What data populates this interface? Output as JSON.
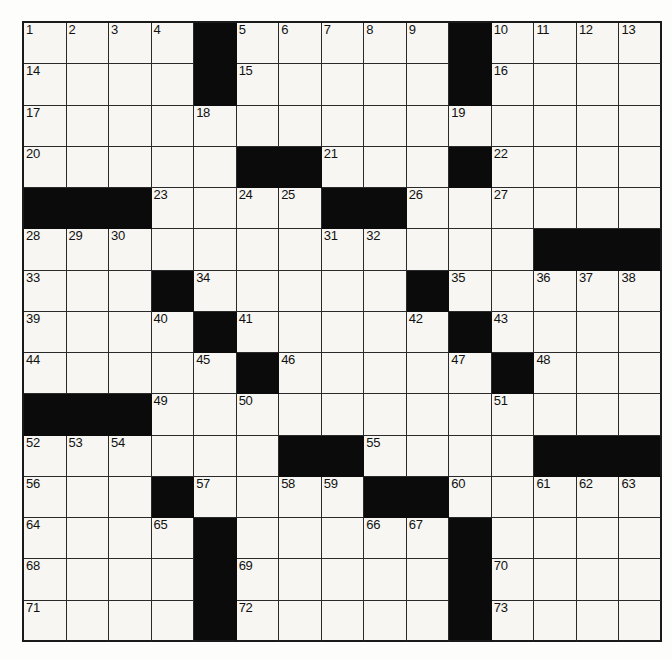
{
  "puzzle": {
    "type": "crossword-grid",
    "rows": 15,
    "columns": 15,
    "cell_background": "#f7f6f2",
    "block_color": "#0b0b0b",
    "line_color": "#2a2a2a",
    "page_background": "#fdfdfb",
    "total_clue_numbers": 73,
    "grid": [
      [
        "1",
        "2",
        "3",
        "4",
        "#",
        "5",
        "6",
        "7",
        "8",
        "9",
        "#",
        "10",
        "11",
        "12",
        "13"
      ],
      [
        "14",
        "",
        "",
        "",
        "#",
        "15",
        "",
        "",
        "",
        "",
        "#",
        "16",
        "",
        "",
        ""
      ],
      [
        "17",
        "",
        "",
        "",
        "18",
        "",
        "",
        "",
        "",
        "",
        "19",
        "",
        "",
        "",
        ""
      ],
      [
        "20",
        "",
        "",
        "",
        "",
        "#",
        "#",
        "21",
        "",
        "",
        "#",
        "22",
        "",
        "",
        ""
      ],
      [
        "#",
        "#",
        "#",
        "23",
        "",
        "24",
        "25",
        "#",
        "#",
        "26",
        "",
        "27",
        "",
        "",
        ""
      ],
      [
        "28",
        "29",
        "30",
        "",
        "",
        "",
        "",
        "31",
        "32",
        "",
        "",
        "",
        "#",
        "#",
        "#"
      ],
      [
        "33",
        "",
        "",
        "#",
        "34",
        "",
        "",
        "",
        "",
        "#",
        "35",
        "",
        "36",
        "37",
        "38"
      ],
      [
        "39",
        "",
        "",
        "40",
        "#",
        "41",
        "",
        "",
        "",
        "42",
        "#",
        "43",
        "",
        "",
        ""
      ],
      [
        "44",
        "",
        "",
        "",
        "45",
        "#",
        "46",
        "",
        "",
        "",
        "47",
        "#",
        "48",
        "",
        ""
      ],
      [
        "#",
        "#",
        "#",
        "49",
        "",
        "50",
        "",
        "",
        "",
        "",
        "",
        "51",
        "",
        "",
        ""
      ],
      [
        "52",
        "53",
        "54",
        "",
        "",
        "",
        "#",
        "#",
        "55",
        "",
        "",
        "",
        "#",
        "#",
        "#"
      ],
      [
        "56",
        "",
        "",
        "#",
        "57",
        "",
        "58",
        "59",
        "#",
        "#",
        "60",
        "",
        "61",
        "62",
        "63"
      ],
      [
        "64",
        "",
        "",
        "65",
        "",
        "",
        "",
        "",
        "66",
        "67",
        "",
        "",
        "",
        "",
        ""
      ],
      [
        "68",
        "",
        "",
        "",
        "#",
        "69",
        "",
        "",
        "",
        "",
        "#",
        "70",
        "",
        "",
        ""
      ],
      [
        "71",
        "",
        "",
        "",
        "#",
        "72",
        "",
        "",
        "",
        "",
        "#",
        "73",
        "",
        "",
        ""
      ]
    ],
    "numbered_cells": [
      {
        "n": "1",
        "row": 0,
        "col": 0
      },
      {
        "n": "2",
        "row": 0,
        "col": 1
      },
      {
        "n": "3",
        "row": 0,
        "col": 2
      },
      {
        "n": "4",
        "row": 0,
        "col": 3
      },
      {
        "n": "5",
        "row": 0,
        "col": 5
      },
      {
        "n": "6",
        "row": 0,
        "col": 6
      },
      {
        "n": "7",
        "row": 0,
        "col": 7
      },
      {
        "n": "8",
        "row": 0,
        "col": 8
      },
      {
        "n": "9",
        "row": 0,
        "col": 9
      },
      {
        "n": "10",
        "row": 0,
        "col": 11
      },
      {
        "n": "11",
        "row": 0,
        "col": 12
      },
      {
        "n": "12",
        "row": 0,
        "col": 13
      },
      {
        "n": "13",
        "row": 0,
        "col": 14
      },
      {
        "n": "14",
        "row": 1,
        "col": 0
      },
      {
        "n": "15",
        "row": 1,
        "col": 5
      },
      {
        "n": "16",
        "row": 1,
        "col": 11
      },
      {
        "n": "17",
        "row": 2,
        "col": 0
      },
      {
        "n": "18",
        "row": 2,
        "col": 4
      },
      {
        "n": "19",
        "row": 2,
        "col": 10
      },
      {
        "n": "20",
        "row": 3,
        "col": 0
      },
      {
        "n": "21",
        "row": 3,
        "col": 7
      },
      {
        "n": "22",
        "row": 3,
        "col": 11
      },
      {
        "n": "23",
        "row": 4,
        "col": 3
      },
      {
        "n": "24",
        "row": 4,
        "col": 5
      },
      {
        "n": "25",
        "row": 4,
        "col": 6
      },
      {
        "n": "26",
        "row": 4,
        "col": 9
      },
      {
        "n": "27",
        "row": 4,
        "col": 11
      },
      {
        "n": "28",
        "row": 5,
        "col": 0
      },
      {
        "n": "29",
        "row": 5,
        "col": 1
      },
      {
        "n": "30",
        "row": 5,
        "col": 2
      },
      {
        "n": "31",
        "row": 5,
        "col": 7
      },
      {
        "n": "32",
        "row": 5,
        "col": 8
      },
      {
        "n": "33",
        "row": 6,
        "col": 0
      },
      {
        "n": "34",
        "row": 6,
        "col": 4
      },
      {
        "n": "35",
        "row": 6,
        "col": 10
      },
      {
        "n": "36",
        "row": 6,
        "col": 12
      },
      {
        "n": "37",
        "row": 6,
        "col": 13
      },
      {
        "n": "38",
        "row": 6,
        "col": 14
      },
      {
        "n": "39",
        "row": 7,
        "col": 0
      },
      {
        "n": "40",
        "row": 7,
        "col": 3
      },
      {
        "n": "41",
        "row": 7,
        "col": 5
      },
      {
        "n": "42",
        "row": 7,
        "col": 9
      },
      {
        "n": "43",
        "row": 7,
        "col": 11
      },
      {
        "n": "44",
        "row": 8,
        "col": 0
      },
      {
        "n": "45",
        "row": 8,
        "col": 4
      },
      {
        "n": "46",
        "row": 8,
        "col": 6
      },
      {
        "n": "47",
        "row": 8,
        "col": 10
      },
      {
        "n": "48",
        "row": 8,
        "col": 12
      },
      {
        "n": "49",
        "row": 9,
        "col": 3
      },
      {
        "n": "50",
        "row": 9,
        "col": 5
      },
      {
        "n": "51",
        "row": 9,
        "col": 11
      },
      {
        "n": "52",
        "row": 10,
        "col": 0
      },
      {
        "n": "53",
        "row": 10,
        "col": 1
      },
      {
        "n": "54",
        "row": 10,
        "col": 2
      },
      {
        "n": "55",
        "row": 10,
        "col": 8
      },
      {
        "n": "56",
        "row": 11,
        "col": 0
      },
      {
        "n": "57",
        "row": 11,
        "col": 4
      },
      {
        "n": "58",
        "row": 11,
        "col": 6
      },
      {
        "n": "59",
        "row": 11,
        "col": 7
      },
      {
        "n": "60",
        "row": 11,
        "col": 10
      },
      {
        "n": "61",
        "row": 11,
        "col": 12
      },
      {
        "n": "62",
        "row": 11,
        "col": 13
      },
      {
        "n": "63",
        "row": 11,
        "col": 14
      },
      {
        "n": "64",
        "row": 12,
        "col": 0
      },
      {
        "n": "65",
        "row": 12,
        "col": 3
      },
      {
        "n": "66",
        "row": 12,
        "col": 8
      },
      {
        "n": "67",
        "row": 12,
        "col": 9
      },
      {
        "n": "68",
        "row": 13,
        "col": 0
      },
      {
        "n": "69",
        "row": 13,
        "col": 5
      },
      {
        "n": "70",
        "row": 13,
        "col": 11
      },
      {
        "n": "71",
        "row": 14,
        "col": 0
      },
      {
        "n": "72",
        "row": 14,
        "col": 5
      },
      {
        "n": "73",
        "row": 14,
        "col": 11
      }
    ],
    "block_cells": [
      {
        "row": 0,
        "col": 4
      },
      {
        "row": 0,
        "col": 10
      },
      {
        "row": 1,
        "col": 4
      },
      {
        "row": 1,
        "col": 10
      },
      {
        "row": 3,
        "col": 5
      },
      {
        "row": 3,
        "col": 6
      },
      {
        "row": 3,
        "col": 10
      },
      {
        "row": 4,
        "col": 0
      },
      {
        "row": 4,
        "col": 1
      },
      {
        "row": 4,
        "col": 2
      },
      {
        "row": 4,
        "col": 7
      },
      {
        "row": 4,
        "col": 8
      },
      {
        "row": 5,
        "col": 12
      },
      {
        "row": 5,
        "col": 13
      },
      {
        "row": 5,
        "col": 14
      },
      {
        "row": 6,
        "col": 3
      },
      {
        "row": 6,
        "col": 9
      },
      {
        "row": 7,
        "col": 4
      },
      {
        "row": 7,
        "col": 10
      },
      {
        "row": 8,
        "col": 5
      },
      {
        "row": 8,
        "col": 11
      },
      {
        "row": 9,
        "col": 0
      },
      {
        "row": 9,
        "col": 1
      },
      {
        "row": 9,
        "col": 2
      },
      {
        "row": 10,
        "col": 6
      },
      {
        "row": 10,
        "col": 7
      },
      {
        "row": 10,
        "col": 12
      },
      {
        "row": 10,
        "col": 13
      },
      {
        "row": 10,
        "col": 14
      },
      {
        "row": 11,
        "col": 3
      },
      {
        "row": 11,
        "col": 8
      },
      {
        "row": 11,
        "col": 9
      },
      {
        "row": 12,
        "col": 4
      },
      {
        "row": 12,
        "col": 10
      },
      {
        "row": 13,
        "col": 4
      },
      {
        "row": 13,
        "col": 10
      },
      {
        "row": 14,
        "col": 4
      },
      {
        "row": 14,
        "col": 10
      }
    ]
  }
}
